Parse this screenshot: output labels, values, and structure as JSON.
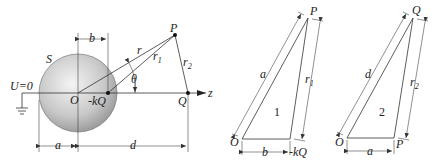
{
  "figure": {
    "main": {
      "sphere_label": "S",
      "ground_label": "U=0",
      "origin_label": "O",
      "image_charge_label": "-kQ",
      "charge_label": "Q",
      "point_label": "P",
      "axis_label": "z",
      "angle_label": "θ",
      "r_label": "r",
      "r1_label": "r",
      "r1_sub": "1",
      "r2_label": "r",
      "r2_sub": "2",
      "dim_a": "a",
      "dim_b": "b",
      "dim_d": "d"
    },
    "triangle1": {
      "number": "1",
      "vertex_o": "O",
      "vertex_p": "P",
      "vertex_kq": "-kQ",
      "side_a": "a",
      "side_b": "b",
      "side_r1": "r",
      "side_r1_sub": "1"
    },
    "triangle2": {
      "number": "2",
      "vertex_o": "O",
      "vertex_q": "Q",
      "vertex_p": "P",
      "side_d": "d",
      "side_a": "a",
      "side_r2": "r",
      "side_r2_sub": "2"
    },
    "colors": {
      "sphere_light": "#f2f2f2",
      "sphere_dark": "#9a9a9a",
      "line": "#333333"
    }
  }
}
